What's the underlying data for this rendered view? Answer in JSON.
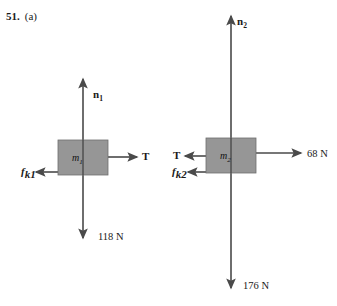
{
  "figure": {
    "problem_number": "51.",
    "part": "(a)",
    "background_color": "#ffffff",
    "stroke_color": "#4a4a4a",
    "block_fill": "#969696",
    "block_stroke": "#6e6e6e"
  },
  "diagrams": [
    {
      "id": "free-body-diagram-m1",
      "body_label": "m",
      "body_subscript": "1",
      "forces": [
        {
          "name": "normal-force",
          "label": "n",
          "subscript": "1",
          "direction": "up",
          "value": ""
        },
        {
          "name": "tension-force",
          "label": "T",
          "subscript": "",
          "direction": "right",
          "value": ""
        },
        {
          "name": "kinetic-friction-force",
          "label": "f",
          "subscript": "k1",
          "direction": "left",
          "value": ""
        },
        {
          "name": "weight-force",
          "label": "",
          "subscript": "",
          "direction": "down",
          "value": "118 N"
        }
      ]
    },
    {
      "id": "free-body-diagram-m2",
      "body_label": "m",
      "body_subscript": "2",
      "forces": [
        {
          "name": "normal-force",
          "label": "n",
          "subscript": "2",
          "direction": "up",
          "value": ""
        },
        {
          "name": "applied-force",
          "label": "",
          "subscript": "",
          "direction": "right",
          "value": "68 N"
        },
        {
          "name": "tension-force",
          "label": "T",
          "subscript": "",
          "direction": "left",
          "value": ""
        },
        {
          "name": "kinetic-friction-force",
          "label": "f",
          "subscript": "k2",
          "direction": "left",
          "value": ""
        },
        {
          "name": "weight-force",
          "label": "",
          "subscript": "",
          "direction": "down",
          "value": "176 N"
        }
      ]
    }
  ]
}
